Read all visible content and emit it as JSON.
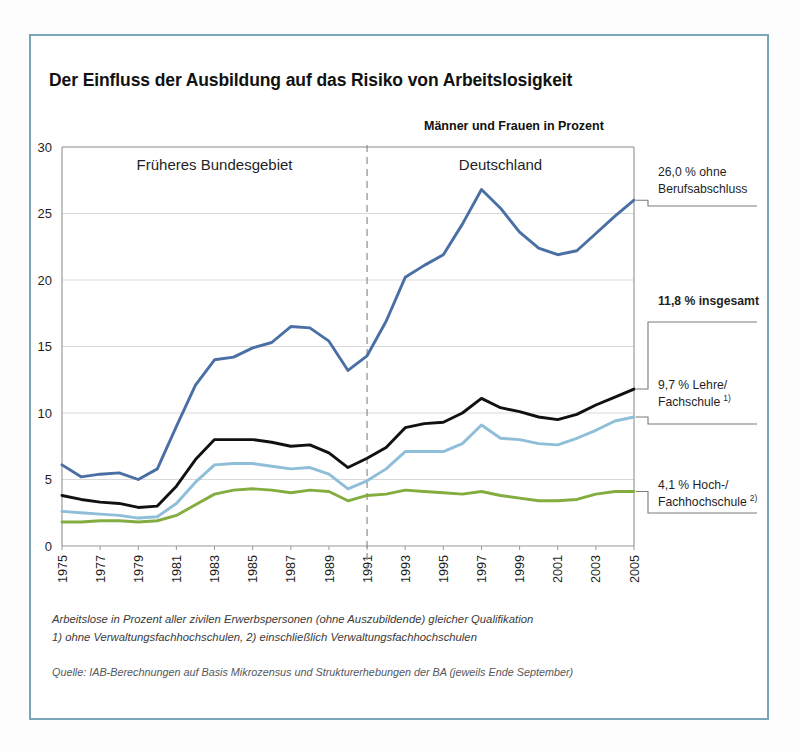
{
  "title": "Der Einfluss der Ausbildung auf das Risiko von Arbeitslosigkeit",
  "subtitle": "Männer und Frauen in Prozent",
  "footnotes": {
    "line1": "Arbeitslose in Prozent aller zivilen Erwerbspersonen (ohne Auszubildende) gleicher Qualifikation",
    "line2": "1) ohne Verwaltungsfachhochschulen, 2) einschließlich Verwaltungsfachhochschulen",
    "source": "Quelle: IAB-Berechnungen auf Basis Mikrozensus und Strukturerhebungen der BA (jeweils Ende September)"
  },
  "regions": [
    {
      "label": "Früheres Bundesgebiet",
      "start_year": 1975,
      "end_year": 1991
    },
    {
      "label": "Deutschland",
      "start_year": 1991,
      "end_year": 2005
    }
  ],
  "divider_year": 1991,
  "colors": {
    "ohne_berufsabschluss": "#4a6fa5",
    "insgesamt": "#111111",
    "lehre_fachschule": "#8ebed8",
    "hochschule": "#83ad3f",
    "frame": "#7ba4b8",
    "grid": "#d9d9d9",
    "axis": "#9a9a9a"
  },
  "annotations": [
    {
      "value_label": "26,0 % ohne",
      "value_label2": "Berufsabschluss",
      "sup": "",
      "bold": false,
      "value": 26.0,
      "series": "ohne_berufsabschluss"
    },
    {
      "value_label": "11,8 % insgesamt",
      "value_label2": "",
      "sup": "",
      "bold": true,
      "value": 11.8,
      "series": "insgesamt"
    },
    {
      "value_label": "9,7 % Lehre/",
      "value_label2": "Fachschule",
      "sup": "1)",
      "bold": false,
      "value": 9.7,
      "series": "lehre_fachschule"
    },
    {
      "value_label": "4,1 % Hoch-/",
      "value_label2": "Fachhochschule",
      "sup": "2)",
      "bold": false,
      "value": 4.1,
      "series": "hochschule"
    }
  ],
  "chart_data": {
    "type": "line",
    "title": "Der Einfluss der Ausbildung auf das Risiko von Arbeitslosigkeit",
    "subtitle": "Männer und Frauen in Prozent",
    "xlabel": "",
    "ylabel": "",
    "xlim": [
      1975,
      2005
    ],
    "ylim": [
      0,
      30
    ],
    "yticks": [
      0,
      5,
      10,
      15,
      20,
      25,
      30
    ],
    "xticks": [
      1975,
      1977,
      1979,
      1981,
      1983,
      1985,
      1987,
      1989,
      1991,
      1993,
      1995,
      1997,
      1999,
      2001,
      2003,
      2005
    ],
    "xtick_rotation": 90,
    "grid": true,
    "legend": "annotations-right",
    "x": [
      1975,
      1976,
      1977,
      1978,
      1979,
      1980,
      1981,
      1982,
      1983,
      1984,
      1985,
      1986,
      1987,
      1988,
      1989,
      1990,
      1991,
      1992,
      1993,
      1994,
      1995,
      1996,
      1997,
      1998,
      1999,
      2000,
      2001,
      2002,
      2003,
      2004,
      2005
    ],
    "series": [
      {
        "name": "ohne Berufsabschluss",
        "color": "#4a6fa5",
        "end_label": "26,0 % ohne Berufsabschluss",
        "values": [
          6.1,
          5.2,
          5.4,
          5.5,
          5.0,
          5.8,
          9.0,
          12.1,
          14.0,
          14.2,
          14.9,
          15.3,
          16.5,
          16.4,
          15.4,
          13.2,
          14.3,
          16.9,
          20.2,
          21.1,
          21.9,
          24.2,
          26.8,
          25.4,
          23.6,
          22.4,
          21.9,
          22.2,
          23.5,
          24.8,
          26.0
        ]
      },
      {
        "name": "insgesamt",
        "color": "#111111",
        "end_label": "11,8 % insgesamt",
        "values": [
          3.8,
          3.5,
          3.3,
          3.2,
          2.9,
          3.0,
          4.5,
          6.5,
          8.0,
          8.0,
          8.0,
          7.8,
          7.5,
          7.6,
          7.0,
          5.9,
          6.6,
          7.4,
          8.9,
          9.2,
          9.3,
          10.0,
          11.1,
          10.4,
          10.1,
          9.7,
          9.5,
          9.9,
          10.6,
          11.2,
          11.8
        ]
      },
      {
        "name": "Lehre/Fachschule",
        "color": "#8ebed8",
        "end_label": "9,7 % Lehre/Fachschule",
        "values": [
          2.6,
          2.5,
          2.4,
          2.3,
          2.1,
          2.2,
          3.2,
          4.8,
          6.1,
          6.2,
          6.2,
          6.0,
          5.8,
          5.9,
          5.4,
          4.3,
          4.9,
          5.8,
          7.1,
          7.1,
          7.1,
          7.7,
          9.1,
          8.1,
          8.0,
          7.7,
          7.6,
          8.1,
          8.7,
          9.4,
          9.7
        ]
      },
      {
        "name": "Hoch-/Fachhochschule",
        "color": "#83ad3f",
        "end_label": "4,1 % Hoch-/Fachhochschule",
        "values": [
          1.8,
          1.8,
          1.9,
          1.9,
          1.8,
          1.9,
          2.3,
          3.1,
          3.9,
          4.2,
          4.3,
          4.2,
          4.0,
          4.2,
          4.1,
          3.4,
          3.8,
          3.9,
          4.2,
          4.1,
          4.0,
          3.9,
          4.1,
          3.8,
          3.6,
          3.4,
          3.4,
          3.5,
          3.9,
          4.1,
          4.1
        ]
      }
    ]
  }
}
